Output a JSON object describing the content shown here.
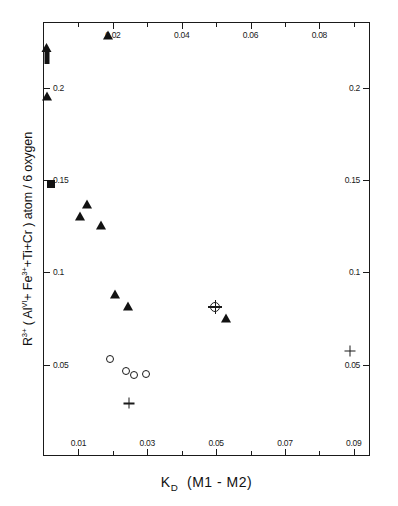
{
  "chart_data": {
    "type": "scatter",
    "title": "",
    "xlabel": "K_D (M1-M2)",
    "ylabel": "R3+ (AlVI+Fe3++Ti+Cr) atom / 6 oxygen",
    "xlim": [
      0.0,
      0.095
    ],
    "ylim": [
      0.0,
      0.235
    ],
    "grid": false,
    "legend": "none",
    "axis": {
      "x_top_ticks": [
        "0.02",
        "0.04",
        "0.06",
        "0.08"
      ],
      "x_top_tick_values": [
        0.02,
        0.04,
        0.06,
        0.08
      ],
      "x_bottom_ticks": [
        "0.01",
        "0.03",
        "0.05",
        "0.07",
        "0.09"
      ],
      "x_bottom_tick_values": [
        0.01,
        0.03,
        0.05,
        0.07,
        0.09
      ],
      "x_minor_tick_values": [
        0.02,
        0.04,
        0.06,
        0.08
      ],
      "y_left_ticks": [
        "0.2",
        "0.15",
        "0.1",
        "0.05"
      ],
      "y_left_tick_values": [
        0.2,
        0.15,
        0.1,
        0.05
      ],
      "y_right_ticks": [
        "0.2",
        "0.15",
        "0.1",
        "0.05"
      ],
      "y_right_tick_values": [
        0.2,
        0.15,
        0.1,
        0.05
      ]
    },
    "series": [
      {
        "name": "filled-triangle",
        "marker": "triangle",
        "points": [
          {
            "x": 0.0185,
            "y": 0.2285
          },
          {
            "x": 0.0008,
            "y": 0.1955
          },
          {
            "x": 0.0125,
            "y": 0.137
          },
          {
            "x": 0.0105,
            "y": 0.1305
          },
          {
            "x": 0.0165,
            "y": 0.1255
          },
          {
            "x": 0.0205,
            "y": 0.088
          },
          {
            "x": 0.0245,
            "y": 0.0815
          },
          {
            "x": 0.053,
            "y": 0.075
          }
        ]
      },
      {
        "name": "filled-square",
        "marker": "square",
        "points": [
          {
            "x": 0.002,
            "y": 0.148
          }
        ]
      },
      {
        "name": "open-circle",
        "marker": "circle",
        "points": [
          {
            "x": 0.0193,
            "y": 0.053
          },
          {
            "x": 0.0262,
            "y": 0.0443
          },
          {
            "x": 0.0297,
            "y": 0.045
          },
          {
            "x": 0.0238,
            "y": 0.0468
          }
        ]
      },
      {
        "name": "plus",
        "marker": "plus",
        "points": [
          {
            "x": 0.0248,
            "y": 0.029
          },
          {
            "x": 0.0888,
            "y": 0.0573
          }
        ]
      },
      {
        "name": "circle-plus",
        "marker": "circle-plus",
        "points": [
          {
            "x": 0.0497,
            "y": 0.0812
          }
        ]
      },
      {
        "name": "up-arrow-offscale",
        "marker": "up-arrow",
        "points": [
          {
            "x": 0.0008,
            "y": 0.218
          }
        ]
      }
    ]
  },
  "labels": {
    "x_title_main": "K",
    "x_title_sub": "D",
    "x_title_rest": "(M1 - M2)",
    "y_title_r": "R",
    "y_title_r_sup": "3+",
    "y_title_open": " ( Al",
    "y_title_al_sup": "VI",
    "y_title_fe": "+ Fe",
    "y_title_fe_sup": "3+",
    "y_title_tail": "+Ti+Cr ) atom / 6 oxygen"
  }
}
